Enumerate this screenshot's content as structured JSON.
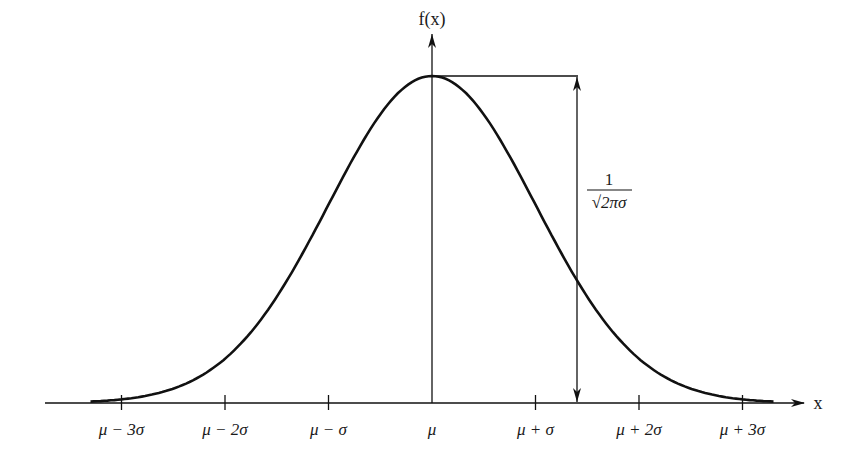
{
  "diagram": {
    "y_axis_label": "f(x)",
    "x_axis_label": "x",
    "peak_annotation": {
      "numerator": "1",
      "denominator": "√2πσ"
    },
    "ticks": [
      {
        "label": "μ − 3σ",
        "k": -3
      },
      {
        "label": "μ − 2σ",
        "k": -2
      },
      {
        "label": "μ − σ",
        "k": -1
      },
      {
        "label": "μ",
        "k": 0
      },
      {
        "label": "μ + σ",
        "k": 1
      },
      {
        "label": "μ + 2σ",
        "k": 2
      },
      {
        "label": "μ + 3σ",
        "k": 3
      }
    ],
    "colors": {
      "stroke": "#111111",
      "background": "#ffffff"
    }
  }
}
